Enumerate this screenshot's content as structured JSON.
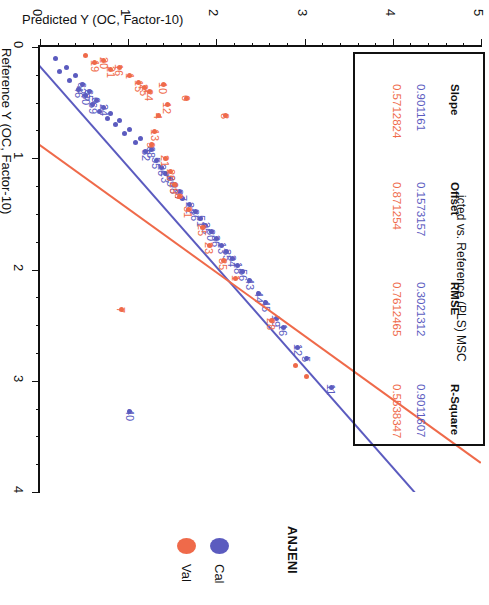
{
  "chart_title": "icted vs. Reference (PLS) MSC",
  "axes": {
    "x_title": "Predicted Y (OC, Factor-10)",
    "y_title": "Reference Y (OC, Factor-10)",
    "x_ticks": [
      "0",
      "1",
      "2",
      "3",
      "4",
      "5"
    ],
    "y_ticks": [
      "0",
      "1",
      "2",
      "3",
      "4"
    ]
  },
  "legend": {
    "title": "ANJENI",
    "items": [
      {
        "label": "Cal",
        "color": "#5b5bbf"
      },
      {
        "label": "Val",
        "color": "#ef6a4a"
      }
    ]
  },
  "stats": {
    "columns": [
      "Slope",
      "Offset",
      "RMSE",
      "R-Square"
    ],
    "rows": [
      {
        "series": "Cal",
        "color": "#5b5bbf",
        "values": [
          "0.901161",
          "0.1573157",
          "0.3021312",
          "0.9011607"
        ]
      },
      {
        "series": "Val",
        "color": "#ef6a4a",
        "values": [
          "0.5712824",
          "0.871254",
          "0.7612465",
          "0.5538347"
        ]
      }
    ]
  },
  "chart_data": {
    "type": "scatter",
    "title": "icted vs. Reference (PLS) MSC",
    "xlabel": "Predicted Y (OC, Factor-10)",
    "ylabel": "Reference Y (OC, Factor-10)",
    "xlim": [
      0,
      5
    ],
    "ylim": [
      0,
      4
    ],
    "grid": false,
    "legend_position": "bottom",
    "orientation": "rotated-90-clockwise",
    "series": [
      {
        "name": "Cal",
        "color": "#5b5bbf",
        "fit": {
          "slope": 0.901161,
          "offset": 0.1573157,
          "rmse": 0.3021312,
          "r_square": 0.9011607
        },
        "points": [
          {
            "x": 0.18,
            "y": 0.1,
            "label": ""
          },
          {
            "x": 0.22,
            "y": 0.22,
            "label": ""
          },
          {
            "x": 0.3,
            "y": 0.18,
            "label": ""
          },
          {
            "x": 0.34,
            "y": 0.3,
            "label": ""
          },
          {
            "x": 0.4,
            "y": 0.26,
            "label": ""
          },
          {
            "x": 0.44,
            "y": 0.38,
            "label": "46"
          },
          {
            "x": 0.48,
            "y": 0.34,
            "label": "62"
          },
          {
            "x": 0.52,
            "y": 0.44,
            "label": "30"
          },
          {
            "x": 0.56,
            "y": 0.4,
            "label": "65"
          },
          {
            "x": 0.6,
            "y": 0.52,
            "label": "69"
          },
          {
            "x": 0.64,
            "y": 0.48,
            "label": "6"
          },
          {
            "x": 0.68,
            "y": 0.58,
            "label": ""
          },
          {
            "x": 0.72,
            "y": 0.54,
            "label": "24"
          },
          {
            "x": 0.76,
            "y": 0.64,
            "label": ""
          },
          {
            "x": 0.8,
            "y": 0.6,
            "label": ""
          },
          {
            "x": 0.86,
            "y": 0.7,
            "label": ""
          },
          {
            "x": 0.9,
            "y": 0.66,
            "label": ""
          },
          {
            "x": 0.96,
            "y": 0.78,
            "label": ""
          },
          {
            "x": 1.02,
            "y": 0.74,
            "label": ""
          },
          {
            "x": 1.08,
            "y": 0.86,
            "label": ""
          },
          {
            "x": 1.14,
            "y": 0.82,
            "label": ""
          },
          {
            "x": 1.2,
            "y": 0.94,
            "label": "82"
          },
          {
            "x": 1.26,
            "y": 0.92,
            "label": "68"
          },
          {
            "x": 1.32,
            "y": 1.02,
            "label": "55"
          },
          {
            "x": 1.38,
            "y": 1.08,
            "label": "26"
          },
          {
            "x": 1.42,
            "y": 1.14,
            "label": "23"
          },
          {
            "x": 1.48,
            "y": 1.18,
            "label": "29"
          },
          {
            "x": 1.52,
            "y": 1.24,
            "label": "98"
          },
          {
            "x": 1.58,
            "y": 1.3,
            "label": "37"
          },
          {
            "x": 1.62,
            "y": 1.36,
            "label": "7"
          },
          {
            "x": 1.7,
            "y": 1.42,
            "label": "22"
          },
          {
            "x": 1.76,
            "y": 1.48,
            "label": "36"
          },
          {
            "x": 1.82,
            "y": 1.54,
            "label": "51"
          },
          {
            "x": 1.88,
            "y": 1.6,
            "label": "25"
          },
          {
            "x": 1.94,
            "y": 1.66,
            "label": "30"
          },
          {
            "x": 2.0,
            "y": 1.72,
            "label": "36"
          },
          {
            "x": 2.06,
            "y": 1.78,
            "label": "13"
          },
          {
            "x": 2.12,
            "y": 1.84,
            "label": "35"
          },
          {
            "x": 2.18,
            "y": 1.9,
            "label": "34"
          },
          {
            "x": 2.24,
            "y": 1.96,
            "label": "18"
          },
          {
            "x": 2.3,
            "y": 2.02,
            "label": "56"
          },
          {
            "x": 2.38,
            "y": 2.1,
            "label": "43"
          },
          {
            "x": 2.48,
            "y": 2.22,
            "label": "44"
          },
          {
            "x": 2.56,
            "y": 2.3,
            "label": "45"
          },
          {
            "x": 2.68,
            "y": 2.44,
            "label": "19"
          },
          {
            "x": 2.76,
            "y": 2.52,
            "label": "16"
          },
          {
            "x": 2.92,
            "y": 2.7,
            "label": "12"
          },
          {
            "x": 3.02,
            "y": 2.8,
            "label": "5"
          },
          {
            "x": 3.3,
            "y": 3.06,
            "label": "11"
          },
          {
            "x": 1.02,
            "y": 3.28,
            "label": "40"
          }
        ]
      },
      {
        "name": "Val",
        "color": "#ef6a4a",
        "fit": {
          "slope": 0.5712824,
          "offset": 0.871254,
          "rmse": 0.7612465,
          "r_square": 0.5538347
        },
        "points": [
          {
            "x": 0.52,
            "y": 0.08,
            "label": ""
          },
          {
            "x": 0.62,
            "y": 0.14,
            "label": "19"
          },
          {
            "x": 0.72,
            "y": 0.12,
            "label": "20"
          },
          {
            "x": 0.8,
            "y": 0.2,
            "label": "21"
          },
          {
            "x": 0.9,
            "y": 0.18,
            "label": "16"
          },
          {
            "x": 1.02,
            "y": 0.26,
            "label": "1"
          },
          {
            "x": 1.12,
            "y": 0.32,
            "label": "15"
          },
          {
            "x": 1.18,
            "y": 0.36,
            "label": "25"
          },
          {
            "x": 1.24,
            "y": 0.4,
            "label": "24"
          },
          {
            "x": 1.4,
            "y": 0.34,
            "label": "10"
          },
          {
            "x": 1.44,
            "y": 0.52,
            "label": "12"
          },
          {
            "x": 1.66,
            "y": 0.46,
            "label": "6"
          },
          {
            "x": 1.34,
            "y": 0.62,
            "label": "4"
          },
          {
            "x": 1.3,
            "y": 0.76,
            "label": "13"
          },
          {
            "x": 1.26,
            "y": 0.88,
            "label": "9"
          },
          {
            "x": 2.1,
            "y": 0.62,
            "label": "8"
          },
          {
            "x": 1.42,
            "y": 1.0,
            "label": "21"
          },
          {
            "x": 1.48,
            "y": 1.12,
            "label": "26"
          },
          {
            "x": 1.52,
            "y": 1.24,
            "label": "29"
          },
          {
            "x": 1.58,
            "y": 1.34,
            "label": "0"
          },
          {
            "x": 1.68,
            "y": 1.46,
            "label": "31"
          },
          {
            "x": 1.84,
            "y": 1.62,
            "label": "25"
          },
          {
            "x": 1.92,
            "y": 1.78,
            "label": "23"
          },
          {
            "x": 2.08,
            "y": 1.92,
            "label": "35"
          },
          {
            "x": 0.92,
            "y": 2.36,
            "label": "7"
          },
          {
            "x": 2.22,
            "y": 2.08,
            "label": "1"
          },
          {
            "x": 2.62,
            "y": 2.46,
            "label": "28"
          },
          {
            "x": 2.9,
            "y": 2.86,
            "label": ""
          },
          {
            "x": 3.02,
            "y": 2.96,
            "label": ""
          }
        ]
      }
    ]
  }
}
